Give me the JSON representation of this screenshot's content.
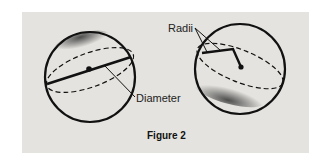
{
  "figure": {
    "caption": "Figure 2",
    "labels": {
      "left": "Diameter",
      "right": "Radii"
    },
    "colors": {
      "panel": "#e4e3df",
      "ink": "#111111"
    }
  }
}
